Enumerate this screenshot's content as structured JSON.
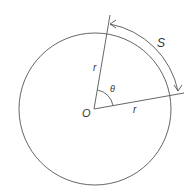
{
  "diagram": {
    "labels": {
      "center": "O",
      "radius_upper": "r",
      "radius_lower": "r",
      "angle": "θ",
      "arc": "S"
    },
    "colors": {
      "stroke": "#555555",
      "text": "#333333",
      "background": "#ffffff"
    }
  }
}
